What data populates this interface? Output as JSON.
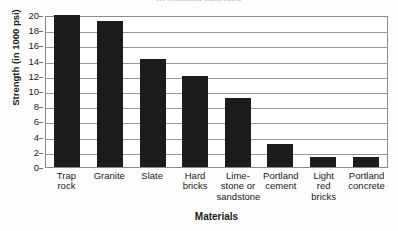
{
  "chart_data": {
    "type": "bar",
    "title": "of common materials",
    "xlabel": "Materials",
    "ylabel": "Strength (in 1000 psi)",
    "categories": [
      "Trap\nrock",
      "Granite",
      "Slate",
      "Hard\nbricks",
      "Lime-\nstone or\nsandstone",
      "Portland\ncement",
      "Light\nred\nbricks",
      "Portland\nconcrete"
    ],
    "category_names": [
      "Trap rock",
      "Granite",
      "Slate",
      "Hard bricks",
      "Limestone or sandstone",
      "Portland cement",
      "Light red bricks",
      "Portland concrete"
    ],
    "values": [
      20,
      19.2,
      14.2,
      12,
      9.1,
      3,
      1.3,
      1.3
    ],
    "ylim": [
      0,
      20
    ],
    "ytick_labels": [
      "20",
      "18",
      "16",
      "14",
      "12",
      "10",
      "8",
      "6",
      "4",
      "2",
      "0"
    ],
    "ytick_values": [
      20,
      18,
      16,
      14,
      12,
      10,
      8,
      6,
      4,
      2,
      0
    ],
    "grid": true,
    "legend": false,
    "bar_color": "#1c1c1c",
    "grid_color": "#9a9a9a",
    "axis_color": "#8a8a8a",
    "background": "#ffffff"
  }
}
